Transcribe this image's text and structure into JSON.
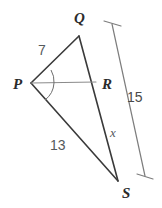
{
  "figure": {
    "type": "geometry-diagram",
    "background_color": "#ffffff",
    "line_color": "#3a3a3a",
    "accent_color": "#7d7d7d",
    "vertices": [
      {
        "name": "Q",
        "label": "Q",
        "x": 79,
        "y": 36,
        "label_x": 74,
        "label_y": 23
      },
      {
        "name": "P",
        "label": "P",
        "x": 31,
        "y": 83,
        "label_x": 13,
        "label_y": 89
      },
      {
        "name": "R",
        "label": "R",
        "x": 96,
        "y": 82,
        "label_x": 102,
        "label_y": 89
      },
      {
        "name": "S",
        "label": "S",
        "x": 118,
        "y": 181,
        "label_x": 122,
        "label_y": 198
      }
    ],
    "segments": [
      {
        "name": "segment-PQ",
        "from": "P",
        "to": "Q",
        "x1": 31,
        "y1": 83,
        "x2": 79,
        "y2": 36
      },
      {
        "name": "segment-QS",
        "from": "Q",
        "to": "S",
        "x1": 79,
        "y1": 36,
        "x2": 118,
        "y2": 181
      },
      {
        "name": "segment-PS",
        "from": "P",
        "to": "S",
        "x1": 31,
        "y1": 83,
        "x2": 118,
        "y2": 181
      },
      {
        "name": "segment-PR",
        "from": "P",
        "to": "R",
        "x1": 31,
        "y1": 83,
        "x2": 96,
        "y2": 82
      }
    ],
    "angle_marks": [
      {
        "name": "angle-QPR-arc",
        "d": "M 51 70 A 23 23 0 0 1 54 83"
      },
      {
        "name": "angle-RPS-arc",
        "d": "M 54 83 A 23 23 0 0 1 45 100"
      }
    ],
    "measure_bar": {
      "name": "measure-bar-QS",
      "value": "15",
      "x1": 112,
      "y1": 24,
      "x2": 145,
      "y2": 176,
      "tick_top": {
        "x1": 104,
        "y1": 21,
        "x2": 121,
        "y2": 26
      },
      "tick_bottom": {
        "x1": 137,
        "y1": 174,
        "x2": 153,
        "y2": 179
      },
      "label_x": 127,
      "label_y": 102
    },
    "side_labels": [
      {
        "name": "label-PQ-length",
        "text": "7",
        "x": 38,
        "y": 55
      },
      {
        "name": "label-PS-length",
        "text": "13",
        "x": 50,
        "y": 150
      },
      {
        "name": "label-RS-length",
        "text": "x",
        "x": 110,
        "y": 137
      },
      {
        "name": "label-QS-measure",
        "text": "15",
        "x": 127,
        "y": 102
      }
    ]
  }
}
